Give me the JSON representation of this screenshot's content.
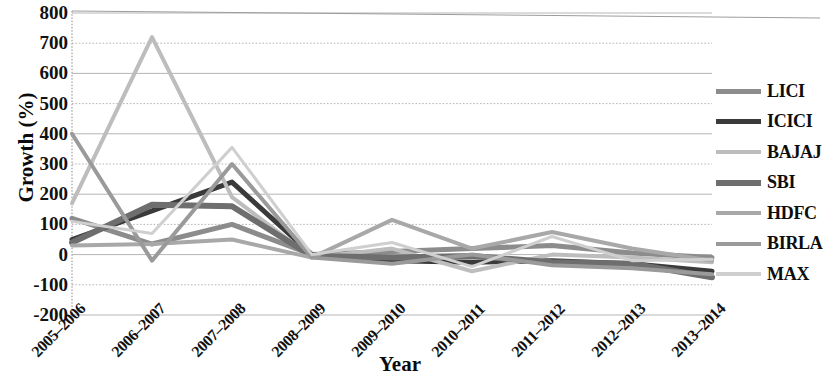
{
  "chart_data": {
    "type": "line",
    "title": "",
    "xlabel": "Year",
    "ylabel": "Growth (%)",
    "categories": [
      "2005–2006",
      "2006–2007",
      "2007–2008",
      "2008–2009",
      "2009–2010",
      "2010–2011",
      "2011–2012",
      "2012–2013",
      "2013–2014"
    ],
    "ylim": [
      -200,
      800
    ],
    "ytick_step": 100,
    "yticks": [
      800,
      700,
      600,
      500,
      400,
      300,
      200,
      100,
      0,
      -100,
      -200
    ],
    "grid": true,
    "legend_position": "right",
    "series": [
      {
        "name": "LICI",
        "color": "#8c8c8c",
        "width": 5,
        "values": [
          120,
          35,
          100,
          0,
          10,
          20,
          30,
          5,
          -10
        ]
      },
      {
        "name": "ICICI",
        "color": "#3a3a3a",
        "width": 5,
        "values": [
          50,
          145,
          240,
          0,
          -20,
          -25,
          -20,
          -30,
          -55
        ]
      },
      {
        "name": "BAJAJ",
        "color": "#bdbdbd",
        "width": 4,
        "values": [
          170,
          720,
          190,
          -10,
          20,
          -55,
          0,
          -10,
          -25
        ]
      },
      {
        "name": "SBI",
        "color": "#6e6e6e",
        "width": 6,
        "values": [
          40,
          165,
          160,
          -5,
          -10,
          -5,
          -25,
          -30,
          -75
        ]
      },
      {
        "name": "HDFC",
        "color": "#a8a8a8",
        "width": 4,
        "values": [
          30,
          35,
          50,
          -10,
          115,
          20,
          75,
          20,
          -20
        ]
      },
      {
        "name": "BIRLA",
        "color": "#9a9a9a",
        "width": 4,
        "values": [
          400,
          -20,
          300,
          -10,
          -30,
          0,
          -35,
          -45,
          -65
        ]
      },
      {
        "name": "MAX",
        "color": "#cfcfcf",
        "width": 3,
        "values": [
          110,
          70,
          355,
          0,
          40,
          -40,
          60,
          -20,
          -15
        ]
      }
    ]
  },
  "axes": {
    "y_title": "Growth (%)",
    "x_title": "Year",
    "y_tick_labels": [
      "800",
      "700",
      "600",
      "500",
      "400",
      "300",
      "200",
      "100",
      "0",
      "-100",
      "-200"
    ],
    "x_tick_labels": [
      "2005–2006",
      "2006–2007",
      "2007–2008",
      "2008–2009",
      "2009–2010",
      "2010–2011",
      "2011–2012",
      "2012–2013",
      "2013–2014"
    ]
  },
  "legend": {
    "items": [
      {
        "label": "LICI",
        "color": "#8c8c8c"
      },
      {
        "label": "ICICI",
        "color": "#3a3a3a"
      },
      {
        "label": "BAJAJ",
        "color": "#bdbdbd"
      },
      {
        "label": "SBI",
        "color": "#6e6e6e"
      },
      {
        "label": "HDFC",
        "color": "#a8a8a8"
      },
      {
        "label": "BIRLA",
        "color": "#9a9a9a"
      },
      {
        "label": "MAX",
        "color": "#cfcfcf"
      }
    ]
  },
  "colors": {
    "grid": "#b6b6b6",
    "axis": "#8a8a8a",
    "text": "#111111",
    "background": "#ffffff"
  }
}
